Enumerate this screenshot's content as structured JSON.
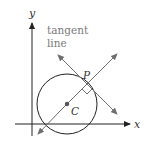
{
  "diagram": {
    "labels": {
      "y_axis": "y",
      "x_axis": "x",
      "tangent_line_1": "tangent",
      "tangent_line_2": "line",
      "point_p": "P",
      "center_c": "C"
    },
    "colors": {
      "axis": "#222222",
      "circle": "#222222",
      "lines": "#6e6e6e",
      "center_dot": "#555555",
      "text": "#7a7a7a"
    }
  }
}
